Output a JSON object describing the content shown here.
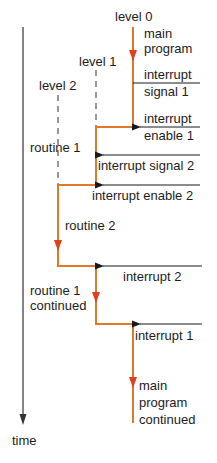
{
  "levels": [
    {
      "label": "level 0"
    },
    {
      "label": "level 1"
    },
    {
      "label": "level 2"
    }
  ],
  "segments": {
    "main_program": {
      "line1": "main",
      "line2": "program"
    },
    "routine_1": "routine 1",
    "routine_2": "routine 2",
    "routine_1_continued": {
      "line1": "routine 1",
      "line2": "continued"
    },
    "main_program_continued": {
      "line1": "main",
      "line2": "program",
      "line3": "continued"
    }
  },
  "signals": {
    "interrupt_signal_1": {
      "line1": "interrupt",
      "line2": "signal 1"
    },
    "interrupt_enable_1": {
      "line1": "interrupt",
      "line2": "enable 1"
    },
    "interrupt_signal_2": "interrupt signal 2",
    "interrupt_enable_2": "interrupt enable 2",
    "interrupt_2": "interrupt 2",
    "interrupt_1": "interrupt 1"
  },
  "axis": {
    "label": "time"
  },
  "colors": {
    "flow": "#e0782a",
    "arrowhead": "#e0401a",
    "signal": "#1a1a1a",
    "dashed": "#333333"
  }
}
